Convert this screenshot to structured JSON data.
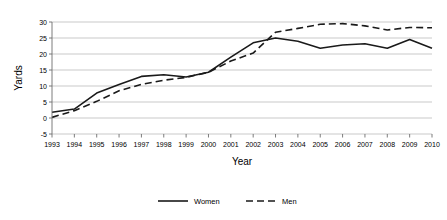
{
  "chart_data": {
    "type": "line",
    "title": "",
    "xlabel": "Year",
    "ylabel": "Yards",
    "x": [
      1993,
      1994,
      1995,
      1996,
      1997,
      1998,
      1999,
      2000,
      2001,
      2002,
      2003,
      2004,
      2005,
      2006,
      2007,
      2008,
      2009,
      2010
    ],
    "xticklabels": [
      "1993",
      "1994",
      "1995",
      "1996",
      "1997",
      "1998",
      "1999",
      "2000",
      "2001",
      "2002",
      "2003",
      "2004",
      "2005",
      "2006",
      "2007",
      "2008",
      "2009",
      "2010"
    ],
    "yticks": [
      -5,
      0,
      5,
      10,
      15,
      20,
      25,
      30
    ],
    "yticklabels": [
      "-5",
      "0",
      "5",
      "10",
      "15",
      "20",
      "25",
      "30"
    ],
    "ylim": [
      -5,
      30
    ],
    "grid": "horizontal",
    "legend_position": "bottom",
    "series": [
      {
        "name": "Women",
        "style": "solid",
        "color": "#1a1a1a",
        "values": [
          1.8,
          2.8,
          7.8,
          10.5,
          13.0,
          13.5,
          12.8,
          14.3,
          19.0,
          23.5,
          25.0,
          24.0,
          21.8,
          22.8,
          23.2,
          21.8,
          24.5,
          21.8
        ]
      },
      {
        "name": "Men",
        "style": "dashed",
        "color": "#1a1a1a",
        "values": [
          0.2,
          2.3,
          5.2,
          8.5,
          10.5,
          11.8,
          12.7,
          14.3,
          17.8,
          20.3,
          26.8,
          28.0,
          29.3,
          29.5,
          28.8,
          27.5,
          28.3,
          28.2
        ]
      }
    ]
  },
  "legend": {
    "items": [
      {
        "label": "Women",
        "style": "solid"
      },
      {
        "label": "Men",
        "style": "dashed"
      }
    ]
  },
  "axes": {
    "x_title": "Year",
    "y_title": "Yards"
  }
}
